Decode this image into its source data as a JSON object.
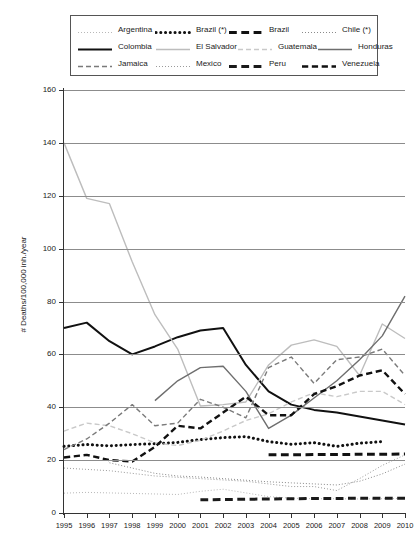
{
  "legend": {
    "rows": [
      [
        {
          "label": "Argentina",
          "style": "dotted-fine",
          "color": "#b8b8b8",
          "width": 1
        },
        {
          "label": "Brazil (*)",
          "style": "dotted-thick",
          "color": "#111111",
          "width": 3
        },
        {
          "label": "Brazil",
          "style": "dashed-thick",
          "color": "#111111",
          "width": 3
        },
        {
          "label": "Chile (*)",
          "style": "dotted-fine",
          "color": "#8a8a8a",
          "width": 1
        }
      ],
      [
        {
          "label": "Colombia",
          "style": "solid",
          "color": "#111111",
          "width": 2
        },
        {
          "label": "El Salvador",
          "style": "solid",
          "color": "#bdbdbd",
          "width": 1.4
        },
        {
          "label": "Guatemala",
          "style": "dashed",
          "color": "#c9c9c9",
          "width": 1.4
        },
        {
          "label": "Honduras",
          "style": "solid",
          "color": "#6e6e6e",
          "width": 1.4
        }
      ],
      [
        {
          "label": "Jamaica",
          "style": "dashed",
          "color": "#7a7a7a",
          "width": 1.4
        },
        {
          "label": "Mexico",
          "style": "dotted-fine",
          "color": "#9a9a9a",
          "width": 1
        },
        {
          "label": "Peru",
          "style": "dashed-thick",
          "color": "#1a1a1a",
          "width": 3
        },
        {
          "label": "Venezuela",
          "style": "dashed-thick",
          "color": "#111111",
          "width": 2.4
        }
      ]
    ]
  },
  "axes": {
    "y_title": "# Deaths/100,000 inh./year",
    "y_ticks": [
      0,
      20,
      40,
      60,
      80,
      100,
      120,
      140,
      160
    ],
    "y_min": 0,
    "y_max": 160,
    "x_ticks": [
      1995,
      1996,
      1997,
      1998,
      1999,
      2000,
      2001,
      2002,
      2003,
      2004,
      2005,
      2006,
      2007,
      2008,
      2009,
      2010
    ],
    "x_min": 1995,
    "x_max": 2010,
    "grid": true
  },
  "chart_data": {
    "type": "line",
    "title": "",
    "xlabel": "",
    "ylabel": "# Deaths/100,000 inh./year",
    "xlim": [
      1995,
      2010
    ],
    "ylim": [
      0,
      160
    ],
    "x": [
      1995,
      1996,
      1997,
      1998,
      1999,
      2000,
      2001,
      2002,
      2003,
      2004,
      2005,
      2006,
      2007,
      2008,
      2009,
      2010
    ],
    "legend_position": "top",
    "series": [
      {
        "name": "Argentina",
        "style": "dotted-fine",
        "color": "#b8b8b8",
        "width": 1,
        "x": [
          1995,
          1996,
          1997,
          1998,
          1999,
          2000,
          2001,
          2002,
          2003,
          2004,
          2005,
          2006,
          2007,
          2008,
          2009,
          2010
        ],
        "values": [
          7.5,
          7.8,
          7.6,
          7.4,
          7.2,
          7.0,
          8.2,
          9.0,
          7.6,
          6.2,
          5.6,
          5.4,
          5.4,
          5.3,
          5.4,
          5.5
        ]
      },
      {
        "name": "Brazil (*)",
        "style": "dotted-thick",
        "color": "#111111",
        "width": 3,
        "x": [
          1995,
          1996,
          1997,
          1998,
          1999,
          2000,
          2001,
          2002,
          2003,
          2004,
          2005,
          2006,
          2007,
          2008,
          2009
        ],
        "values": [
          25.2,
          25.9,
          25.4,
          25.9,
          26.2,
          26.7,
          27.8,
          28.5,
          28.9,
          27.0,
          26.0,
          26.6,
          25.2,
          26.4,
          27.0
        ]
      },
      {
        "name": "Brazil",
        "style": "dashed-thick",
        "color": "#111111",
        "width": 3,
        "x": [
          2004,
          2005,
          2006,
          2007,
          2008,
          2009,
          2010
        ],
        "values": [
          22.0,
          22.0,
          22.1,
          22.1,
          22.2,
          22.2,
          22.3
        ]
      },
      {
        "name": "Chile (*)",
        "style": "dotted-fine",
        "color": "#8a8a8a",
        "width": 1,
        "x": [
          1997,
          1998,
          1999,
          2000,
          2001,
          2002,
          2003,
          2004,
          2005,
          2006,
          2007,
          2008,
          2009,
          2010
        ],
        "values": [
          19.0,
          17.0,
          15.0,
          14.0,
          13.6,
          13.0,
          12.4,
          11.8,
          11.4,
          11.0,
          10.6,
          12.0,
          14.8,
          18.5
        ]
      },
      {
        "name": "Colombia",
        "style": "solid",
        "color": "#111111",
        "width": 2,
        "x": [
          1995,
          1996,
          1997,
          1998,
          1999,
          2000,
          2001,
          2002,
          2003,
          2004,
          2005,
          2006,
          2007,
          2008,
          2009,
          2010
        ],
        "values": [
          70.0,
          72.0,
          65.0,
          60.0,
          63.0,
          66.5,
          69.0,
          70.0,
          56.0,
          46.0,
          41.0,
          39.0,
          38.0,
          36.5,
          35.0,
          33.5
        ]
      },
      {
        "name": "El Salvador",
        "style": "solid",
        "color": "#bdbdbd",
        "width": 1.4,
        "x": [
          1995,
          1996,
          1997,
          1998,
          1999,
          2000,
          2001,
          2002,
          2003,
          2004,
          2005,
          2006,
          2007,
          2008,
          2009,
          2010
        ],
        "values": [
          140.0,
          119.0,
          117.0,
          95.0,
          75.0,
          62.0,
          40.5,
          41.0,
          42.0,
          56.0,
          63.5,
          65.5,
          63.0,
          52.0,
          71.5,
          66.0
        ]
      },
      {
        "name": "Guatemala",
        "style": "dashed",
        "color": "#c9c9c9",
        "width": 1.4,
        "x": [
          1995,
          1996,
          1997,
          1998,
          1999,
          2000,
          2001,
          2002,
          2003,
          2004,
          2005,
          2006,
          2007,
          2008,
          2009,
          2010
        ],
        "values": [
          31.0,
          34.0,
          33.0,
          30.0,
          26.5,
          25.5,
          27.5,
          31.0,
          35.0,
          37.5,
          42.0,
          45.5,
          44.0,
          46.0,
          46.0,
          41.0
        ]
      },
      {
        "name": "Honduras",
        "style": "solid",
        "color": "#6e6e6e",
        "width": 1.4,
        "x": [
          1999,
          2000,
          2001,
          2002,
          2003,
          2004,
          2005,
          2006,
          2007,
          2008,
          2009,
          2010
        ],
        "values": [
          42.5,
          50.0,
          55.0,
          55.5,
          46.0,
          32.0,
          37.0,
          43.5,
          50.0,
          58.0,
          67.0,
          82.0
        ]
      },
      {
        "name": "Jamaica",
        "style": "dashed",
        "color": "#7a7a7a",
        "width": 1.4,
        "x": [
          1995,
          1996,
          1997,
          1998,
          1999,
          2000,
          2001,
          2002,
          2003,
          2004,
          2005,
          2006,
          2007,
          2008,
          2009,
          2010
        ],
        "values": [
          24.0,
          28.0,
          34.0,
          41.0,
          33.0,
          34.0,
          43.0,
          40.0,
          36.0,
          55.0,
          59.0,
          49.0,
          58.0,
          59.0,
          62.0,
          52.0
        ]
      },
      {
        "name": "Mexico",
        "style": "dotted-fine",
        "color": "#9a9a9a",
        "width": 1,
        "x": [
          1995,
          1996,
          1997,
          1998,
          1999,
          2000,
          2001,
          2002,
          2003,
          2004,
          2005,
          2006,
          2007,
          2008,
          2009,
          2010
        ],
        "values": [
          17.0,
          16.5,
          16.0,
          15.0,
          14.0,
          13.5,
          13.0,
          12.5,
          12.0,
          11.0,
          10.0,
          10.0,
          8.5,
          13.0,
          18.0,
          22.0
        ]
      },
      {
        "name": "Peru",
        "style": "dashed-thick",
        "color": "#1a1a1a",
        "width": 3,
        "x": [
          2001,
          2002,
          2003,
          2004,
          2005,
          2006,
          2007,
          2008,
          2009,
          2010
        ],
        "values": [
          5.0,
          5.1,
          5.2,
          5.3,
          5.4,
          5.5,
          5.5,
          5.6,
          5.6,
          5.6
        ]
      },
      {
        "name": "Venezuela",
        "style": "dashed-thick",
        "color": "#111111",
        "width": 2.4,
        "x": [
          1995,
          1996,
          1997,
          1998,
          1999,
          2000,
          2001,
          2002,
          2003,
          2004,
          2005,
          2006,
          2007,
          2008,
          2009,
          2010
        ],
        "values": [
          21.0,
          22.0,
          20.0,
          19.5,
          25.0,
          33.0,
          32.0,
          38.0,
          44.0,
          37.0,
          37.0,
          45.0,
          48.0,
          52.0,
          54.0,
          45.0
        ]
      }
    ]
  }
}
